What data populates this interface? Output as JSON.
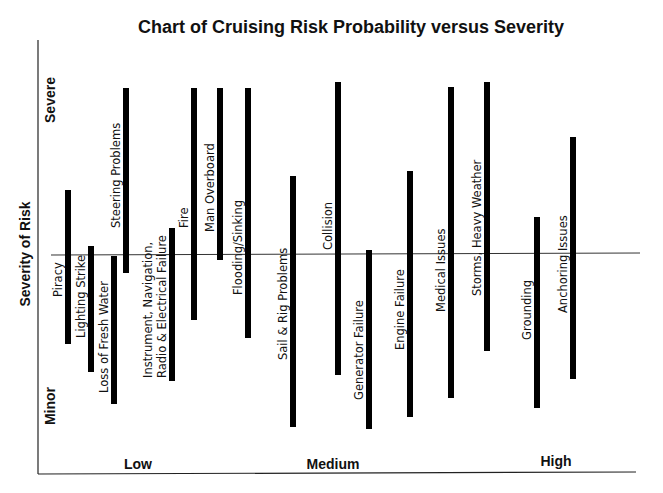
{
  "chart_data": {
    "type": "bar",
    "subtype": "floating-range-vertical",
    "title": "Chart of Cruising Risk Probability versus Severity",
    "xlabel": "",
    "ylabel": "Severity of Risk",
    "x_tick_labels": [
      "Low",
      "Medium",
      "High"
    ],
    "y_tick_labels": [
      "Minor",
      "Severe"
    ],
    "grid": false,
    "legend": null,
    "reference_line": "horizontal midline at medium severity",
    "value_scale": "pixel-derived severity 0 (Minor) to 100 (Severe); probability position 0 (Low) to 100 (High)",
    "series": [
      {
        "name": "Piracy",
        "probability": 5,
        "severity_low": 33,
        "severity_high": 70
      },
      {
        "name": "Lighting Strike",
        "probability": 9,
        "severity_low": 26,
        "severity_high": 56
      },
      {
        "name": "Loss of Fresh Water",
        "probability": 13,
        "severity_low": 18,
        "severity_high": 53
      },
      {
        "name": "Steering Problems",
        "probability": 15,
        "severity_low": 48,
        "severity_high": 92
      },
      {
        "name": "Instrument, Navigation, Radio & Electrical Failure",
        "probability": 22,
        "severity_low": 23,
        "severity_high": 60
      },
      {
        "name": "Fire",
        "probability": 26,
        "severity_low": 37,
        "severity_high": 92
      },
      {
        "name": "Man Overboard",
        "probability": 30,
        "severity_low": 51,
        "severity_high": 92
      },
      {
        "name": "Flooding/Sinking",
        "probability": 35,
        "severity_low": 33,
        "severity_high": 92
      },
      {
        "name": "Sail & Rig Problems",
        "probability": 43,
        "severity_low": 10,
        "severity_high": 70
      },
      {
        "name": "Collision",
        "probability": 50,
        "severity_low": 23,
        "severity_high": 93
      },
      {
        "name": "Generator Failure",
        "probability": 56,
        "severity_low": 10,
        "severity_high": 53
      },
      {
        "name": "Engine Failure",
        "probability": 62,
        "severity_low": 13,
        "severity_high": 71
      },
      {
        "name": "Medical Issues",
        "probability": 69,
        "severity_low": 18,
        "severity_high": 92
      },
      {
        "name": "Storms, Heavy Weather",
        "probability": 75,
        "severity_low": 29,
        "severity_high": 93
      },
      {
        "name": "Grounding",
        "probability": 84,
        "severity_low": 16,
        "severity_high": 62
      },
      {
        "name": "Anchoring Issues",
        "probability": 90,
        "severity_low": 23,
        "severity_high": 81
      }
    ]
  },
  "labels": {
    "title": "Chart of Cruising Risk Probability versus Severity",
    "y_axis": "Severity of Risk",
    "y_top": "Severe",
    "y_bottom": "Minor",
    "x_low": "Low",
    "x_medium": "Medium",
    "x_high": "High"
  },
  "bars": [
    {
      "label": "Piracy",
      "x": 68,
      "top": 190,
      "bottom": 344,
      "label_x": 62,
      "label_y": 297,
      "lines": [
        "Piracy"
      ]
    },
    {
      "label": "Lighting Strike",
      "x": 91,
      "top": 246,
      "bottom": 372,
      "label_x": 85,
      "label_y": 338,
      "lines": [
        "Lighting Strike"
      ]
    },
    {
      "label": "Loss of Fresh Water",
      "x": 114,
      "top": 256,
      "bottom": 404,
      "label_x": 108,
      "label_y": 393,
      "lines": [
        "Loss of Fresh Water"
      ]
    },
    {
      "label": "Steering Problems",
      "x": 126,
      "top": 88,
      "bottom": 273,
      "label_x": 120,
      "label_y": 228,
      "lines": [
        "Steering Problems"
      ]
    },
    {
      "label": "Instrument, Navigation, Radio & Electrical Failure",
      "x": 172,
      "top": 228,
      "bottom": 381,
      "label_x": 152,
      "label_y": 378,
      "lines": [
        "Instrument, Navigation,",
        "Radio & Electrical Failure"
      ]
    },
    {
      "label": "Fire",
      "x": 194,
      "top": 88,
      "bottom": 320,
      "label_x": 188,
      "label_y": 228,
      "lines": [
        "Fire"
      ]
    },
    {
      "label": "Man Overboard",
      "x": 220,
      "top": 88,
      "bottom": 260,
      "label_x": 214,
      "label_y": 232,
      "lines": [
        "Man Overboard"
      ]
    },
    {
      "label": "Flooding/Sinking",
      "x": 248,
      "top": 88,
      "bottom": 338,
      "label_x": 242,
      "label_y": 295,
      "lines": [
        "Flooding/Sinking"
      ]
    },
    {
      "label": "Sail & Rig Problems",
      "x": 293,
      "top": 176,
      "bottom": 427,
      "label_x": 287,
      "label_y": 360,
      "lines": [
        "Sail & Rig Problems"
      ]
    },
    {
      "label": "Collision",
      "x": 338,
      "top": 82,
      "bottom": 375,
      "label_x": 332,
      "label_y": 250,
      "lines": [
        "Collision"
      ]
    },
    {
      "label": "Generator Failure",
      "x": 369,
      "top": 250,
      "bottom": 429,
      "label_x": 363,
      "label_y": 400,
      "lines": [
        "Generator Failure"
      ]
    },
    {
      "label": "Engine Failure",
      "x": 410,
      "top": 171,
      "bottom": 417,
      "label_x": 404,
      "label_y": 350,
      "lines": [
        "Engine Failure"
      ]
    },
    {
      "label": "Medical Issues",
      "x": 451,
      "top": 87,
      "bottom": 398,
      "label_x": 445,
      "label_y": 312,
      "lines": [
        "Medical Issues"
      ]
    },
    {
      "label": "Storms, Heavy Weather",
      "x": 487,
      "top": 82,
      "bottom": 351,
      "label_x": 481,
      "label_y": 296,
      "lines": [
        "Storms, Heavy Weather"
      ]
    },
    {
      "label": "Grounding",
      "x": 537,
      "top": 217,
      "bottom": 408,
      "label_x": 531,
      "label_y": 340,
      "lines": [
        "Grounding"
      ]
    },
    {
      "label": "Anchoring Issues",
      "x": 573,
      "top": 137,
      "bottom": 379,
      "label_x": 567,
      "label_y": 313,
      "lines": [
        "Anchoring Issues"
      ]
    }
  ],
  "colors": {
    "bar": "#000000",
    "axis": "#222222",
    "text": "#111111",
    "background": "#ffffff"
  }
}
